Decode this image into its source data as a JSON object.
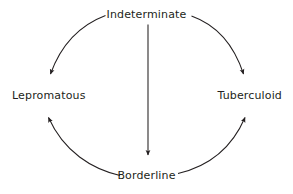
{
  "diagram": {
    "type": "cycle-diagram",
    "background_color": "#ffffff",
    "stroke_color": "#231f20",
    "text_color": "#231f20",
    "nodes": [
      {
        "id": "indeterminate",
        "label": "Indeterminate",
        "position": "top"
      },
      {
        "id": "lepromatous",
        "label": "Lepromatous",
        "position": "left"
      },
      {
        "id": "tuberculoid",
        "label": "Tuberculoid",
        "position": "right"
      },
      {
        "id": "borderline",
        "label": "Borderline",
        "position": "bottom"
      }
    ],
    "edges": [
      {
        "id": "indeterminate-to-lepromatous",
        "from": "Indeterminate",
        "to": "Lepromatous",
        "shape": "curved-arc",
        "direction": "counterclockwise"
      },
      {
        "id": "indeterminate-to-tuberculoid",
        "from": "Indeterminate",
        "to": "Tuberculoid",
        "shape": "curved-arc",
        "direction": "clockwise"
      },
      {
        "id": "indeterminate-to-borderline",
        "from": "Indeterminate",
        "to": "Borderline",
        "shape": "straight-vertical"
      },
      {
        "id": "borderline-to-lepromatous",
        "from": "Borderline",
        "to": "Lepromatous",
        "shape": "curved-arc",
        "direction": "clockwise"
      },
      {
        "id": "borderline-to-tuberculoid",
        "from": "Borderline",
        "to": "Tuberculoid",
        "shape": "curved-arc",
        "direction": "counterclockwise"
      }
    ]
  }
}
